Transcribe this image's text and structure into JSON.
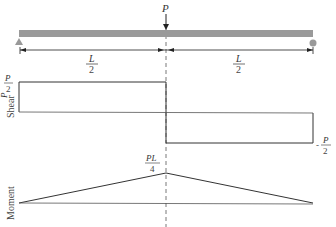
{
  "diagram": {
    "type": "beam shear and moment diagram",
    "beam": {
      "load_label": "P",
      "left_support": "pin",
      "right_support": "roller",
      "span_left_label": {
        "num": "L",
        "den": "2"
      },
      "span_right_label": {
        "num": "L",
        "den": "2"
      },
      "color": "#9a9a9a"
    },
    "shear": {
      "axis_label": "Shear",
      "positive_label": {
        "num": "P",
        "den": "2"
      },
      "negative_label": {
        "sign": "-",
        "num": "P",
        "den": "2"
      }
    },
    "moment": {
      "axis_label": "Moment",
      "peak_label": {
        "num": "PL",
        "den": "4"
      }
    }
  }
}
